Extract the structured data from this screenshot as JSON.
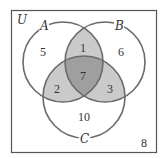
{
  "diagram": {
    "type": "venn-3-set",
    "universe_label": "U",
    "sets": [
      {
        "label": "A",
        "cx": 63,
        "cy": 62,
        "r": 40
      },
      {
        "label": "B",
        "cx": 105,
        "cy": 62,
        "r": 40
      },
      {
        "label": "C",
        "cx": 84,
        "cy": 97,
        "r": 41
      }
    ],
    "regions": {
      "A_only": "5",
      "B_only": "6",
      "C_only": "10",
      "A_and_B_only": "1",
      "A_and_C_only": "2",
      "B_and_C_only": "3",
      "A_and_B_and_C": "7",
      "outside": "8"
    },
    "colors": {
      "frame": "#555555",
      "circle_stroke": "#6a6a6a",
      "two_overlap_fill": "#c9c9c9",
      "three_overlap_fill": "#9e9e9e",
      "background": "#ffffff"
    }
  }
}
